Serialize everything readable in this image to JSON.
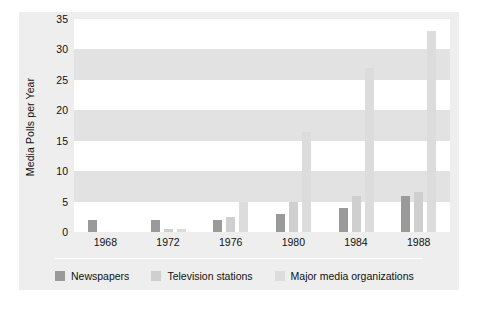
{
  "chart_data": {
    "type": "bar",
    "title": "",
    "subtitle": "",
    "xlabel": "",
    "ylabel": "Media Polls per Year",
    "categories": [
      "1968",
      "1972",
      "1976",
      "1980",
      "1984",
      "1988"
    ],
    "series": [
      {
        "name": "Newspapers",
        "color": "#9a9a9a",
        "values": [
          2,
          2,
          2,
          3,
          4,
          6
        ]
      },
      {
        "name": "Television stations",
        "color": "#cfcfcf",
        "values": [
          0,
          0.5,
          2.5,
          5,
          6,
          6.5
        ]
      },
      {
        "name": "Major media organizations",
        "color": "#dcdcdc",
        "values": [
          0,
          0.5,
          5,
          16.5,
          27,
          33
        ]
      }
    ],
    "ylim": [
      0,
      35
    ],
    "yticks": [
      0,
      5,
      10,
      15,
      20,
      25,
      30,
      35
    ],
    "ytick_labels": [
      "0",
      "5",
      "10",
      "15",
      "20",
      "25",
      "30",
      "35"
    ],
    "grid": "horizontal-bands",
    "legend_position": "bottom"
  },
  "legend": {
    "items": [
      {
        "label": "Newspapers",
        "color": "#9a9a9a"
      },
      {
        "label": "Television stations",
        "color": "#cfcfcf"
      },
      {
        "label": "Major media organizations",
        "color": "#dcdcdc"
      }
    ]
  },
  "colors": {
    "panel_background": "#eeeeee",
    "plot_background": "#ffffff",
    "band": "#e2e2e2",
    "text": "#111111"
  }
}
